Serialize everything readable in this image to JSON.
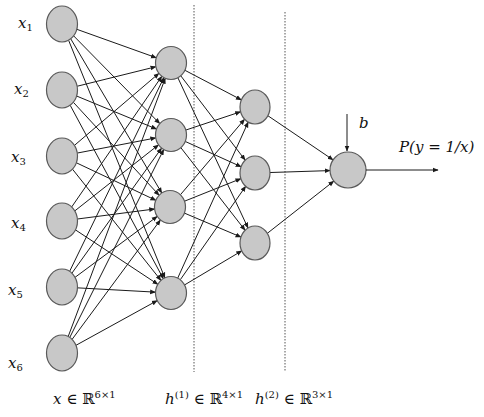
{
  "diagram": {
    "colors": {
      "node_fill": "#c8c8c8",
      "node_stroke": "#5a5a5a",
      "edge": "#1a1a1a",
      "background": "#ffffff"
    },
    "layers": [
      {
        "name": "input",
        "nodes": [
          {
            "label": "x",
            "sub": "1",
            "cx": 62,
            "cy": 24,
            "rx": 15.5,
            "ry": 18
          },
          {
            "label": "x",
            "sub": "2",
            "cx": 62,
            "cy": 90,
            "rx": 15.5,
            "ry": 18
          },
          {
            "label": "x",
            "sub": "3",
            "cx": 62,
            "cy": 156,
            "rx": 15.5,
            "ry": 18
          },
          {
            "label": "x",
            "sub": "4",
            "cx": 62,
            "cy": 221,
            "rx": 15.5,
            "ry": 18
          },
          {
            "label": "x",
            "sub": "5",
            "cx": 62,
            "cy": 287,
            "rx": 15.5,
            "ry": 18
          },
          {
            "label": "x",
            "sub": "6",
            "cx": 62,
            "cy": 353,
            "rx": 15.5,
            "ry": 18
          }
        ]
      },
      {
        "name": "hidden1",
        "nodes": [
          {
            "cx": 171,
            "cy": 63,
            "rx": 15.5,
            "ry": 16.5
          },
          {
            "cx": 171,
            "cy": 135,
            "rx": 15.5,
            "ry": 16.5
          },
          {
            "cx": 170,
            "cy": 207,
            "rx": 15.5,
            "ry": 16.5
          },
          {
            "cx": 171,
            "cy": 293,
            "rx": 15.5,
            "ry": 16.5
          }
        ]
      },
      {
        "name": "hidden2",
        "nodes": [
          {
            "cx": 255,
            "cy": 107,
            "rx": 15,
            "ry": 17
          },
          {
            "cx": 255,
            "cy": 173,
            "rx": 15,
            "ry": 17
          },
          {
            "cx": 255,
            "cy": 243,
            "rx": 15,
            "ry": 17
          }
        ]
      },
      {
        "name": "output",
        "nodes": [
          {
            "cx": 348,
            "cy": 170,
            "rx": 18,
            "ry": 18
          }
        ]
      }
    ],
    "dividers": [
      {
        "x": 194,
        "y1": 5,
        "y2": 372
      },
      {
        "x": 285,
        "y1": 12,
        "y2": 372
      }
    ],
    "bias": {
      "label": "b",
      "x": 347,
      "y1": 114,
      "y2": 151
    },
    "output_arrow": {
      "label": "P(y = 1/x)",
      "x1": 366,
      "x2": 438,
      "y": 170
    },
    "dimension_labels": [
      {
        "var": "x",
        "sup_var": "",
        "set": "ℝ",
        "dim": "6×1"
      },
      {
        "var": "h",
        "sup_var": "(1)",
        "set": "ℝ",
        "dim": "4×1"
      },
      {
        "var": "h",
        "sup_var": "(2)",
        "set": "ℝ",
        "dim": "3×1"
      }
    ]
  }
}
